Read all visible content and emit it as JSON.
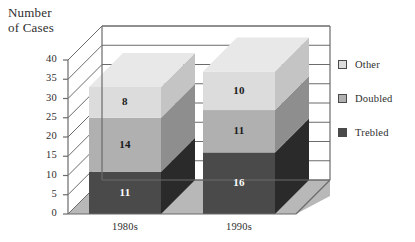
{
  "chart_data": {
    "type": "bar",
    "title": "Number\nof Cases",
    "subtitle": "",
    "xlabel": "",
    "ylabel": "Number of Cases",
    "categories": [
      "1980s",
      "1990s"
    ],
    "series": [
      {
        "name": "Trebled",
        "values": [
          11,
          16
        ],
        "color": "#4a4a4a"
      },
      {
        "name": "Doubled",
        "values": [
          14,
          11
        ],
        "color": "#b0b0b0"
      },
      {
        "name": "Other",
        "values": [
          8,
          10
        ],
        "color": "#dcdcdc"
      }
    ],
    "stacked": true,
    "three_d": true,
    "totals": [
      33,
      37
    ],
    "ylim": [
      0,
      40
    ],
    "yticks": [
      "0",
      "5",
      "10",
      "15",
      "20",
      "25",
      "30",
      "35",
      "40"
    ],
    "ytick_values": [
      0,
      5,
      10,
      15,
      20,
      25,
      30,
      35,
      40
    ],
    "grid": true,
    "legend_position": "right",
    "legend_entries": [
      "Other",
      "Doubled",
      "Trebled"
    ],
    "value_labels": {
      "1980s": {
        "Other": "8",
        "Doubled": "14",
        "Trebled": "11"
      },
      "1990s": {
        "Other": "10",
        "Doubled": "11",
        "Trebled": "16"
      }
    }
  },
  "colors": {
    "other_top": "#e8e8e8",
    "other_front": "#dcdcdc",
    "other_side": "#c4c4c4",
    "doubled_front": "#b0b0b0",
    "doubled_side": "#8e8e8e",
    "trebled_front": "#4a4a4a",
    "trebled_side": "#2a2a2a",
    "floor": "#b8b8b8",
    "wall": "#ffffff",
    "line": "#6b6b6b",
    "text": "#2e2e2e",
    "label_dark": "#1a1a1a",
    "label_light": "#ffffff"
  }
}
